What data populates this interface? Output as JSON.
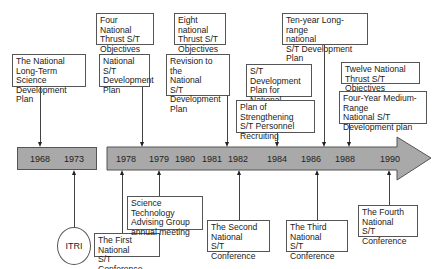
{
  "timeline": {
    "years_left": [
      "1968",
      "1973"
    ],
    "years_right": [
      "1978",
      "1979",
      "1980",
      "1981",
      "1982",
      "1984",
      "1986",
      "1988",
      "1990"
    ],
    "bar_color": "#a9a9a9"
  },
  "above_events": [
    {
      "id": "a1",
      "text": "The National\nLong-Term Science\nDevelopment Plan",
      "year": "1968"
    },
    {
      "id": "a2",
      "text": "Four National\nThrust S/T\nObjectives",
      "year": "1978"
    },
    {
      "id": "a3",
      "text": "National S/T\nDevelopment\nPlan",
      "year": "1978"
    },
    {
      "id": "a4",
      "text": "Eight national\nThrust S/T\nObjectives",
      "year": "1982"
    },
    {
      "id": "a5",
      "text": "Revision to the\nNational\nS/T Development\nPlan",
      "year": "1982"
    },
    {
      "id": "a6",
      "text": "S/T Development\nPlan for National\nDefense",
      "year": "1984"
    },
    {
      "id": "a7",
      "text": "Plan of Strengthening\nS/T Personnel\nRecruiting",
      "year": "1984"
    },
    {
      "id": "a8",
      "text": "Ten-year Long-range\nnational\nS/T Development Plan",
      "year": "1986"
    },
    {
      "id": "a9",
      "text": "Twelve National\nThrust S/T Objectives",
      "year": "1988"
    },
    {
      "id": "a10",
      "text": "Four-Year Medium-Range\nNational S/T\nDevelopment plan",
      "year": "1988"
    }
  ],
  "below_events": [
    {
      "id": "b1",
      "text": "ITRI",
      "year": "1973",
      "shape": "circle"
    },
    {
      "id": "b2",
      "text": "The First National\nS/T Conference",
      "year": "1978"
    },
    {
      "id": "b3",
      "text": "Science Technology\nAdvising Group\nannual meeting",
      "year": "1979"
    },
    {
      "id": "b4",
      "text": "The Second\nNational\nS/T Conference",
      "year": "1982"
    },
    {
      "id": "b5",
      "text": "The Third\nNational\nS/T Conference",
      "year": "1986"
    },
    {
      "id": "b6",
      "text": "The Fourth\nNational\nS/T Conference",
      "year": "1990"
    }
  ]
}
